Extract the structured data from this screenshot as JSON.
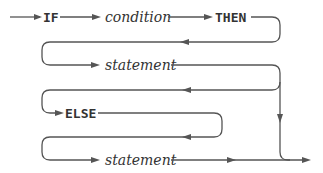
{
  "diagram": {
    "type": "syntax-railroad",
    "colors": {
      "line": "#555555",
      "text": "#333333",
      "background": "#ffffff"
    },
    "rows": [
      {
        "items": [
          {
            "kind": "keyword",
            "text": "IF"
          },
          {
            "kind": "nonterminal",
            "text": "condition"
          },
          {
            "kind": "keyword",
            "text": "THEN"
          }
        ]
      },
      {
        "items": [
          {
            "kind": "nonterminal",
            "text": "statement"
          }
        ]
      },
      {
        "items": [
          {
            "kind": "keyword",
            "text": "ELSE"
          }
        ]
      },
      {
        "items": [
          {
            "kind": "nonterminal",
            "text": "statement"
          }
        ]
      }
    ],
    "labels": {
      "if": "IF",
      "condition": "condition",
      "then": "THEN",
      "statement1": "statement",
      "else": "ELSE",
      "statement2": "statement"
    },
    "edges": [
      {
        "from": "start",
        "to": "IF"
      },
      {
        "from": "IF",
        "to": "condition"
      },
      {
        "from": "condition",
        "to": "THEN"
      },
      {
        "from": "THEN",
        "to": "statement1"
      },
      {
        "from": "statement1",
        "to": "ELSE"
      },
      {
        "from": "statement1",
        "to": "end",
        "note": "bypass (optional ELSE)"
      },
      {
        "from": "ELSE",
        "to": "statement2"
      },
      {
        "from": "statement2",
        "to": "end"
      }
    ]
  }
}
